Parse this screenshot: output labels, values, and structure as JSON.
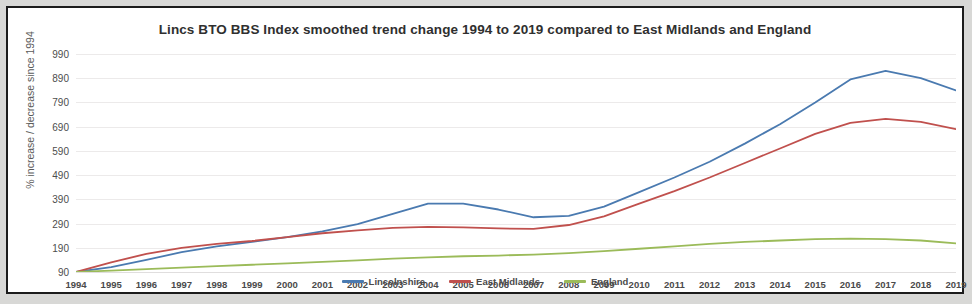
{
  "chart_data": {
    "type": "line",
    "title": "Lincs BTO BBS Index smoothed trend change 1994 to 2019 compared to East Midlands and England",
    "xlabel": "",
    "ylabel": "% increase / decrease since 1994",
    "ylim": [
      90,
      990
    ],
    "ytick_step": 100,
    "yticks": [
      990,
      890,
      790,
      690,
      590,
      490,
      390,
      290,
      190,
      90
    ],
    "grid": true,
    "legend_position": "bottom",
    "x": [
      1994,
      1995,
      1996,
      1997,
      1998,
      1999,
      2000,
      2001,
      2002,
      2003,
      2004,
      2005,
      2006,
      2007,
      2008,
      2009,
      2010,
      2011,
      2012,
      2013,
      2014,
      2015,
      2016,
      2017,
      2018,
      2019
    ],
    "categories": [
      "1994",
      "1995",
      "1996",
      "1997",
      "1998",
      "1999",
      "2000",
      "2001",
      "2002",
      "2003",
      "2004",
      "2005",
      "2006",
      "2007",
      "2008",
      "2009",
      "2010",
      "2011",
      "2012",
      "2013",
      "2014",
      "2015",
      "2016",
      "2017",
      "2018",
      "2019"
    ],
    "series": [
      {
        "name": "Lincolnshire",
        "color": "#4a7ab0",
        "values": [
          90,
          110,
          140,
          172,
          196,
          214,
          234,
          258,
          288,
          330,
          372,
          372,
          348,
          316,
          322,
          360,
          420,
          480,
          545,
          620,
          700,
          790,
          885,
          920,
          890,
          840
        ]
      },
      {
        "name": "East Midlands",
        "color": "#c0504d",
        "values": [
          90,
          130,
          165,
          190,
          206,
          218,
          234,
          250,
          262,
          272,
          276,
          274,
          270,
          268,
          284,
          320,
          372,
          424,
          480,
          540,
          600,
          660,
          706,
          722,
          710,
          680
        ]
      },
      {
        "name": "England",
        "color": "#9bbb59",
        "values": [
          90,
          96,
          102,
          108,
          114,
          120,
          126,
          132,
          138,
          145,
          150,
          155,
          158,
          162,
          168,
          176,
          186,
          196,
          206,
          214,
          220,
          226,
          228,
          226,
          220,
          208
        ]
      }
    ]
  },
  "legend": {
    "items": [
      {
        "label": "Lincolnshire",
        "color": "#4a7ab0"
      },
      {
        "label": "East Midlands",
        "color": "#c0504d"
      },
      {
        "label": "England",
        "color": "#9bbb59"
      }
    ]
  }
}
